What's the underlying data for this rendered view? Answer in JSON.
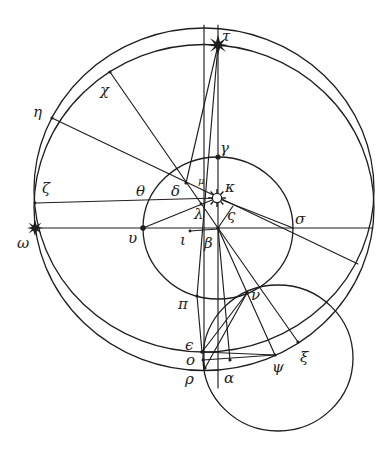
{
  "figure": {
    "type": "geometric astronomical construction",
    "circles": [
      {
        "id": "outer-circle-a",
        "description": "large eccentric circle (upper)"
      },
      {
        "id": "outer-circle-b",
        "description": "large eccentric circle (lower)"
      },
      {
        "id": "middle-circle",
        "description": "circle centred at beta"
      },
      {
        "id": "small-circle",
        "description": "small circle at lower right"
      }
    ],
    "symbols": {
      "tau": "star",
      "omega": "star",
      "kappa": "sun"
    },
    "labels": {
      "tau": "τ",
      "chi": "χ",
      "eta": "η",
      "gamma": "γ",
      "mu": "μ",
      "kappa": "κ",
      "delta": "δ",
      "theta": "θ",
      "zeta": "ζ",
      "lambda": "λ",
      "final_sigma": "ς",
      "omega": "ω",
      "upsilon": "υ",
      "iota": "ι",
      "beta": "β",
      "sigma": "σ",
      "pi": "π",
      "nu": "ν",
      "epsilon": "ϵ",
      "omicron": "ο",
      "rho": "ρ",
      "alpha": "α",
      "psi": "ψ",
      "xi": "ξ"
    }
  }
}
